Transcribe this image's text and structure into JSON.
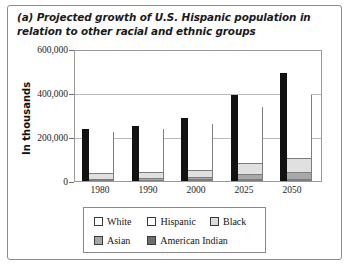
{
  "caption": "(a) Projected growth of U.S. Hispanic population in relation to other racial and ethnic groups",
  "chart_data": {
    "type": "bar",
    "title": "(a) Projected growth of U.S. Hispanic population in relation to other racial and ethnic groups",
    "subtitle": "",
    "xlabel": "",
    "ylabel": "In thousands",
    "ylim": [
      0,
      600000
    ],
    "yticks": [
      0,
      200000,
      400000,
      600000
    ],
    "ytick_labels": [
      "0",
      "200,000",
      "400,000",
      "600,000"
    ],
    "grid": true,
    "legend_position": "bottom",
    "categories": [
      "1980",
      "1990",
      "2000",
      "2025",
      "2050"
    ],
    "stacked": true,
    "series": [
      {
        "name": "White",
        "color": "#ffffff",
        "values": [
          195000,
          200000,
          216000,
          265000,
          295000
        ]
      },
      {
        "name": "Hispanic",
        "color": "#ffffff",
        "values": [
          14600,
          22400,
          31400,
          59600,
          96500
        ]
      },
      {
        "name": "Black",
        "color": "#e0e0e0",
        "values": [
          26500,
          30000,
          34000,
          50000,
          62000
        ]
      },
      {
        "name": "Asian",
        "color": "#a8a8a8",
        "values": [
          3500,
          7300,
          10600,
          24000,
          34000
        ]
      },
      {
        "name": "American Indian",
        "color": "#7a7a7a",
        "values": [
          1400,
          2000,
          2400,
          4000,
          5300
        ]
      }
    ],
    "totals": [
      240000,
      255000,
      290000,
      395000,
      500000
    ]
  },
  "legend": {
    "row1": [
      {
        "label": "White",
        "color": "#ffffff"
      },
      {
        "label": "Hispanic",
        "color": "#ffffff"
      },
      {
        "label": "Black",
        "color": "#dcdcdc"
      }
    ],
    "row2": [
      {
        "label": "Asian",
        "color": "#a6a6a6"
      },
      {
        "label": "American Indian",
        "color": "#6e6e6e"
      }
    ]
  }
}
